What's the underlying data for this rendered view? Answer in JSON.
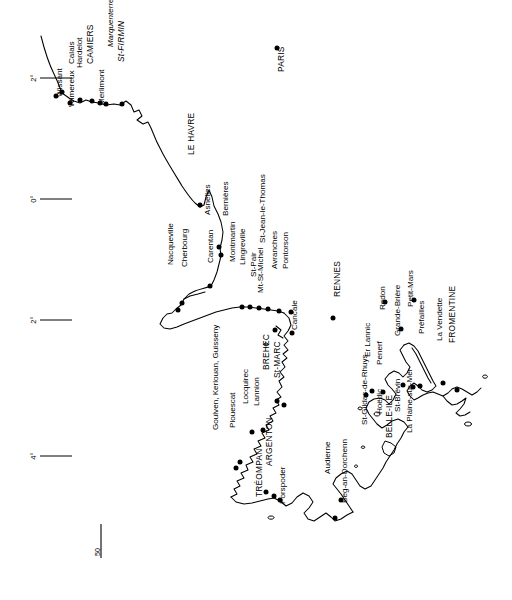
{
  "map": {
    "title": "Coastal map of northern and western France",
    "orientation_note": "All labels rotated 90 degrees (reading bottom-to-top)",
    "background_color": "#ffffff",
    "line_color": "#000000",
    "graticule": {
      "label": "longitude ticks",
      "ticks": [
        {
          "id": "tick-2e",
          "text": "2°",
          "x": 36,
          "y": 78
        },
        {
          "id": "tick-0",
          "text": "0°",
          "x": 36,
          "y": 199
        },
        {
          "id": "tick-2w",
          "text": "2°",
          "x": 36,
          "y": 320
        },
        {
          "id": "tick-4w",
          "text": "4°",
          "x": 36,
          "y": 456
        }
      ]
    },
    "scalebar": {
      "label": "50",
      "x": 100,
      "y": 556,
      "length_px": 34
    },
    "cities": [
      {
        "name": "Calais",
        "x": 74,
        "y": 64,
        "style": "normal",
        "dot": true,
        "dot_x": 62,
        "dot_y": 92,
        "lx": 70,
        "ly": 88
      },
      {
        "name": "Wissant",
        "x": 62,
        "y": 97,
        "style": "normal",
        "dot": true,
        "dot_x": 56,
        "dot_y": 96,
        "lx": 62,
        "ly": 135
      },
      {
        "name": "Wimereux",
        "x": 74,
        "y": 107,
        "style": "normal",
        "dot": true,
        "dot_x": 70,
        "dot_y": 103,
        "lx": 74,
        "ly": 148
      },
      {
        "name": "Hardelot",
        "x": 82,
        "y": 68,
        "style": "normal",
        "dot": true,
        "dot_x": 80,
        "dot_y": 100,
        "lx": 88,
        "ly": 96
      },
      {
        "name": "CAMIERS",
        "x": 93,
        "y": 64,
        "style": "caps",
        "dot": true,
        "dot_x": 92,
        "dot_y": 101,
        "lx": 99,
        "ly": 97
      },
      {
        "name": "Merlimont",
        "x": 104,
        "y": 105,
        "style": "normal",
        "dot": true,
        "dot_x": 100,
        "dot_y": 103,
        "lx": 104,
        "ly": 148
      },
      {
        "name": "Marquenterre",
        "x": 113,
        "y": 47,
        "style": "italic",
        "dot": true,
        "dot_x": 106,
        "dot_y": 104,
        "lx": 113,
        "ly": 101
      },
      {
        "name": "St-FIRMIN",
        "x": 124,
        "y": 62,
        "style": "caps-italic",
        "dot": true,
        "dot_x": 122,
        "dot_y": 104,
        "lx": 129,
        "ly": 99
      },
      {
        "name": "LE HAVRE",
        "x": 194,
        "y": 155,
        "style": "caps",
        "dot": true,
        "dot_x": 200,
        "dot_y": 205,
        "lx": 199,
        "ly": 201
      },
      {
        "name": "Asnelles",
        "x": 210,
        "y": 215,
        "style": "normal",
        "dot": true,
        "dot_x": 219,
        "dot_y": 247,
        "lx": 216,
        "ly": 243
      },
      {
        "name": "Bernières",
        "x": 228,
        "y": 216,
        "style": "normal",
        "dot": true,
        "dot_x": 221,
        "dot_y": 255,
        "lx": 228,
        "ly": 251
      },
      {
        "name": "Nacqueville",
        "x": 173,
        "y": 265,
        "style": "normal",
        "dot": true,
        "dot_x": 178,
        "dot_y": 310,
        "lx": 177,
        "ly": 303
      },
      {
        "name": "Cherbourg",
        "x": 187,
        "y": 267,
        "style": "normal",
        "dot": true,
        "dot_x": 182,
        "dot_y": 303,
        "lx": 187,
        "ly": 300
      },
      {
        "name": "Carentan",
        "x": 213,
        "y": 263,
        "style": "normal",
        "dot": true,
        "dot_x": 210,
        "dot_y": 286,
        "lx": 216,
        "ly": 283
      },
      {
        "name": "Montmartin",
        "x": 235,
        "y": 262,
        "style": "normal",
        "dot": true,
        "dot_x": 242,
        "dot_y": 307,
        "lx": 240,
        "ly": 302
      },
      {
        "name": "Lingreville",
        "x": 245,
        "y": 265,
        "style": "normal",
        "dot": true,
        "dot_x": 250,
        "dot_y": 307,
        "lx": 249,
        "ly": 303
      },
      {
        "name": "St-Pair",
        "x": 256,
        "y": 277,
        "style": "normal",
        "dot": true,
        "dot_x": 259,
        "dot_y": 308,
        "lx": 260,
        "ly": 305
      },
      {
        "name": "St-Jean-le-Thomas",
        "x": 265,
        "y": 243,
        "style": "normal",
        "dot": true,
        "dot_x": 268,
        "dot_y": 309,
        "lx": 269,
        "ly": 305
      },
      {
        "name": "Avranches",
        "x": 277,
        "y": 269,
        "style": "normal",
        "dot": true,
        "dot_x": 279,
        "dot_y": 311,
        "lx": 281,
        "ly": 307
      },
      {
        "name": "Pontorson",
        "x": 288,
        "y": 269,
        "style": "normal",
        "dot": true,
        "dot_x": 291,
        "dot_y": 312,
        "lx": 292,
        "ly": 308
      },
      {
        "name": "Mt-St-Michel",
        "x": 263,
        "y": 293,
        "style": "normal",
        "dot": true,
        "dot_x": 275,
        "dot_y": 330,
        "lx": 268,
        "ly": 326
      },
      {
        "name": "Cancale",
        "x": 297,
        "y": 330,
        "style": "normal",
        "dot": true,
        "dot_x": 292,
        "dot_y": 333,
        "lx": 297,
        "ly": 370
      },
      {
        "name": "BREHEC",
        "x": 269,
        "y": 370,
        "style": "caps",
        "dot": true,
        "dot_x": 277,
        "dot_y": 401,
        "lx": 272,
        "ly": 397
      },
      {
        "name": "St-MARC",
        "x": 280,
        "y": 378,
        "style": "caps",
        "dot": true,
        "dot_x": 284,
        "dot_y": 405,
        "lx": 283,
        "ly": 400
      },
      {
        "name": "Lannion",
        "x": 259,
        "y": 406,
        "style": "normal",
        "dot": true,
        "dot_x": 263,
        "dot_y": 430,
        "lx": 263,
        "ly": 427
      },
      {
        "name": "Locquirec",
        "x": 248,
        "y": 404,
        "style": "normal",
        "dot": true,
        "dot_x": 252,
        "dot_y": 432,
        "lx": 252,
        "ly": 429
      },
      {
        "name": "Plouescat",
        "x": 235,
        "y": 428,
        "style": "normal",
        "dot": true,
        "dot_x": 240,
        "dot_y": 462,
        "lx": 239,
        "ly": 458
      },
      {
        "name": "Goulven, Kerlouan, Guisseny",
        "x": 218,
        "y": 430,
        "style": "normal",
        "dot": true,
        "dot_x": 236,
        "dot_y": 468,
        "lx": 225,
        "ly": 464
      },
      {
        "name": "ARGENTON",
        "x": 272,
        "y": 466,
        "style": "caps",
        "dot": true,
        "dot_x": 274,
        "dot_y": 496,
        "lx": 276,
        "ly": 492
      },
      {
        "name": "TRÉOMPAN",
        "x": 262,
        "y": 497,
        "style": "caps",
        "dot": true,
        "dot_x": 266,
        "dot_y": 492,
        "lx": 266,
        "ly": 540
      },
      {
        "name": "Porspoder",
        "x": 285,
        "y": 504,
        "style": "normal",
        "dot": true,
        "dot_x": 280,
        "dot_y": 500,
        "lx": 285,
        "ly": 546
      },
      {
        "name": "Audierne",
        "x": 330,
        "y": 474,
        "style": "normal",
        "dot": true,
        "dot_x": 335,
        "dot_y": 518,
        "lx": 334,
        "ly": 514
      },
      {
        "name": "Beg-an-Dorchenn",
        "x": 347,
        "y": 503,
        "style": "normal",
        "dot": true,
        "dot_x": 341,
        "dot_y": 500,
        "lx": 347,
        "ly": 568
      },
      {
        "name": "St-Gildas-de-Rhuys",
        "x": 367,
        "y": 425,
        "style": "normal",
        "dot": true,
        "dot_x": 366,
        "dot_y": 395,
        "lx": 372,
        "ly": 420
      },
      {
        "name": "Er Lannic",
        "x": 370,
        "y": 357,
        "style": "normal",
        "dot": true,
        "dot_x": 372,
        "dot_y": 391,
        "lx": 374,
        "ly": 386
      },
      {
        "name": "Penerf",
        "x": 382,
        "y": 365,
        "style": "normal",
        "dot": true,
        "dot_x": 383,
        "dot_y": 392,
        "lx": 386,
        "ly": 389
      },
      {
        "name": "Hoëdic",
        "x": 382,
        "y": 414,
        "style": "normal",
        "dot": false,
        "dot_x": 0,
        "dot_y": 0,
        "lx": 0,
        "ly": 0
      },
      {
        "name": "BELLE-ILE",
        "x": 392,
        "y": 438,
        "style": "caps",
        "dot": false,
        "dot_x": 0,
        "dot_y": 0,
        "lx": 0,
        "ly": 0
      },
      {
        "name": "Redon",
        "x": 385,
        "y": 310,
        "style": "normal",
        "dot": true,
        "dot_x": 385,
        "dot_y": 302,
        "lx": 389,
        "ly": 330
      },
      {
        "name": "Grande-Brière",
        "x": 400,
        "y": 336,
        "style": "normal",
        "dot": true,
        "dot_x": 401,
        "dot_y": 329,
        "lx": 404,
        "ly": 368
      },
      {
        "name": "Petit-Mars",
        "x": 413,
        "y": 307,
        "style": "normal",
        "dot": true,
        "dot_x": 414,
        "dot_y": 300,
        "lx": 417,
        "ly": 327
      },
      {
        "name": "St-Brévin",
        "x": 400,
        "y": 412,
        "style": "normal",
        "dot": true,
        "dot_x": 403,
        "dot_y": 385,
        "lx": 403,
        "ly": 408
      },
      {
        "name": "La Plaine-sur-Mer",
        "x": 412,
        "y": 433,
        "style": "normal",
        "dot": true,
        "dot_x": 413,
        "dot_y": 387,
        "lx": 416,
        "ly": 428
      },
      {
        "name": "Préfailles",
        "x": 424,
        "y": 334,
        "style": "normal",
        "dot": true,
        "dot_x": 420,
        "dot_y": 386,
        "lx": 428,
        "ly": 382
      },
      {
        "name": "La Vendette",
        "x": 442,
        "y": 341,
        "style": "normal",
        "dot": true,
        "dot_x": 443,
        "dot_y": 383,
        "lx": 446,
        "ly": 380
      },
      {
        "name": "FROMENTINE",
        "x": 455,
        "y": 343,
        "style": "caps",
        "dot": true,
        "dot_x": 457,
        "dot_y": 390,
        "lx": 460,
        "ly": 387
      },
      {
        "name": "PARIS",
        "x": 284,
        "y": 72,
        "style": "caps",
        "dot": true,
        "dot_x": 277,
        "dot_y": 48,
        "lx": 284,
        "ly": 102
      },
      {
        "name": "RENNES",
        "x": 340,
        "y": 297,
        "style": "caps",
        "dot": true,
        "dot_x": 333,
        "dot_y": 318,
        "lx": 340,
        "ly": 338
      }
    ]
  }
}
